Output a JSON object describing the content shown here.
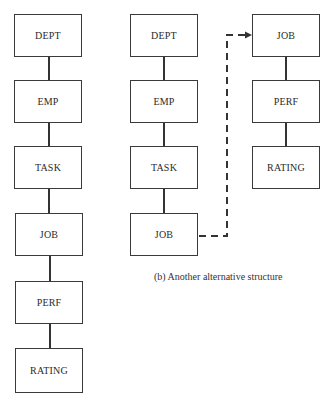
{
  "diagram": {
    "left_structure": {
      "nodes": [
        "DEPT",
        "EMP",
        "TASK",
        "JOB",
        "PERF",
        "RATING"
      ]
    },
    "middle_structure": {
      "nodes": [
        "DEPT",
        "EMP",
        "TASK",
        "JOB"
      ]
    },
    "right_structure": {
      "nodes": [
        "JOB",
        "PERF",
        "RATING"
      ]
    },
    "pointer": {
      "from": "JOB (middle)",
      "to": "JOB (right)",
      "style": "dashed-arrow"
    },
    "caption": "(b)  Another alternative structure"
  }
}
